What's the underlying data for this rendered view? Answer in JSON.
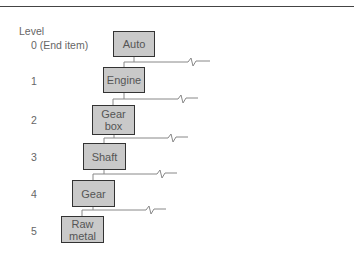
{
  "diagram": {
    "header_label": "Level",
    "levels": [
      {
        "level": "0 (End item)",
        "item": "Auto"
      },
      {
        "level": "1",
        "item": "Engine"
      },
      {
        "level": "2",
        "item": "Gear\nbox"
      },
      {
        "level": "3",
        "item": "Shaft"
      },
      {
        "level": "4",
        "item": "Gear"
      },
      {
        "level": "5",
        "item": "Raw\nmetal"
      }
    ],
    "colors": {
      "box_fill": "#c9c9c9",
      "box_border": "#333333",
      "line": "#888888"
    }
  }
}
